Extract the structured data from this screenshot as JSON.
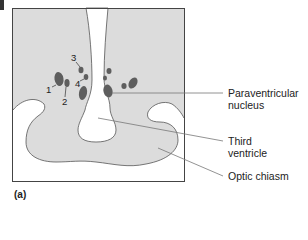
{
  "figure": {
    "panel_label": "(a)",
    "numbers": [
      "1",
      "2",
      "3",
      "4"
    ],
    "labels": {
      "paraventricular_line1": "Paraventricular",
      "paraventricular_line2": "nucleus",
      "third_ventricle_line1": "Third",
      "third_ventricle_line2": "ventricle",
      "optic_chiasm": "Optic chiasm"
    },
    "colors": {
      "tissue_fill": "#dcdcdc",
      "nucleus_fill": "#5e5e5e",
      "outline": "#555555",
      "background": "#ffffff"
    }
  }
}
